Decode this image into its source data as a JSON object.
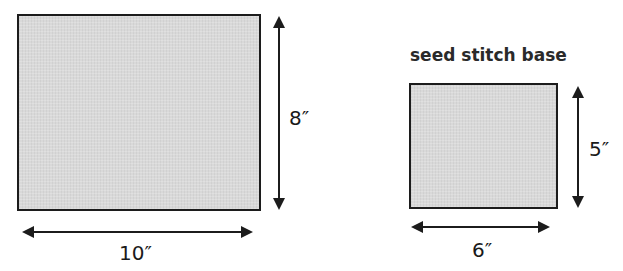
{
  "diagram": {
    "large_panel": {
      "width_label": "10″",
      "height_label": "8″"
    },
    "small_panel": {
      "title": "seed stitch base",
      "width_label": "6″",
      "height_label": "5″"
    }
  },
  "colors": {
    "fill": "#d9d9d9",
    "stroke": "#1c1c1c"
  }
}
